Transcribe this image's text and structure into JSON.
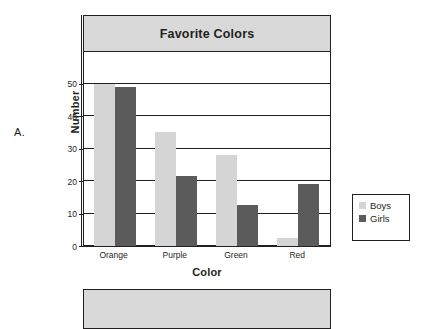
{
  "figure": {
    "label": "A."
  },
  "chart_data": {
    "type": "bar",
    "title": "Favorite Colors",
    "xlabel": "Color",
    "ylabel": "Number",
    "categories": [
      "Orange",
      "Purple",
      "Green",
      "Red"
    ],
    "series": [
      {
        "name": "Boys",
        "color": "#d5d5d5",
        "values": [
          50,
          35,
          28,
          2.5
        ]
      },
      {
        "name": "Girls",
        "color": "#5b5b5b",
        "values": [
          49,
          21.5,
          12.5,
          19
        ]
      }
    ],
    "ylim": [
      0,
      60
    ],
    "yticks": [
      0,
      10,
      20,
      30,
      40,
      50
    ],
    "ytick_labels": [
      "0",
      "10",
      "20",
      "30",
      "40",
      "50"
    ],
    "grid": true,
    "grid_orientation": "horizontal",
    "legend_position": "right-outside",
    "legend_entries": [
      "Boys",
      "Girls"
    ],
    "bar_mode": "grouped"
  },
  "legend": {
    "items": [
      {
        "label": "Boys",
        "swatch": "boys-swatch"
      },
      {
        "label": "Girls",
        "swatch": "girls-swatch"
      }
    ]
  }
}
